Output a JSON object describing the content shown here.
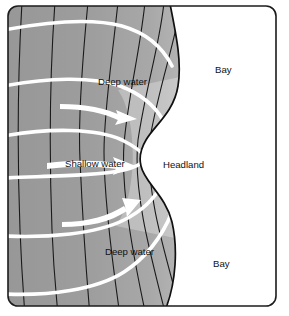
{
  "figure": {
    "frame": {
      "border_color": "#1c1c1c",
      "corner_radius": 10
    },
    "colors": {
      "deep_water": "#9a9a9a",
      "mid_water": "#b4b4b4",
      "shallow_water": "#e2e2e2",
      "land": "#ffffff",
      "coastline": "#111111",
      "contour_line": "#1a1a1a",
      "wave_crest": "#ffffff",
      "arrow": "#ffffff",
      "label_text": "#111111"
    },
    "labels": [
      {
        "id": "deep-water-top",
        "text": "Deep water",
        "x": 98,
        "y": 82
      },
      {
        "id": "shallow-water",
        "text": "Shallow water",
        "x": 65,
        "y": 164
      },
      {
        "id": "headland",
        "text": "Headland",
        "x": 163,
        "y": 165
      },
      {
        "id": "bay-top",
        "text": "Bay",
        "x": 215,
        "y": 70
      },
      {
        "id": "bay-bottom",
        "text": "Bay",
        "x": 213,
        "y": 264
      },
      {
        "id": "deep-water-bottom",
        "text": "Deep water",
        "x": 105,
        "y": 252
      }
    ],
    "features": {
      "coastline_name": "coastline",
      "headland_count": 1,
      "bay_count": 2,
      "contour_count": 7,
      "wave_crest_count": 6,
      "arrow_count": 3
    },
    "legend_note": "Wave crests (white bands) refract and converge on the headland; energy diverges in the bays."
  }
}
